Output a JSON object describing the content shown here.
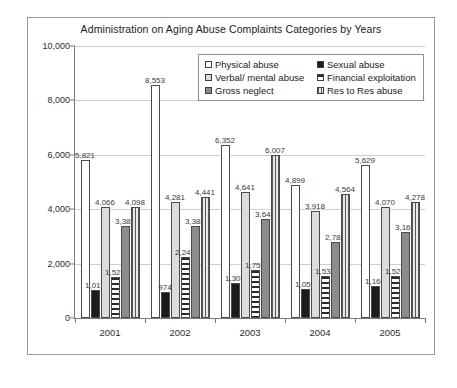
{
  "chart_data": {
    "type": "bar",
    "title": "Administration on Aging Abuse Complaints Categories by Years",
    "xlabel": "",
    "ylabel": "",
    "ylim": [
      0,
      10000
    ],
    "grid": true,
    "legend_position": "top-center-inside",
    "categories": [
      "2001",
      "2002",
      "2003",
      "2004",
      "2005"
    ],
    "ytick_labels": [
      "0",
      "2,000",
      "4,000",
      "6,000",
      "8,000",
      "10,000"
    ],
    "ytick_values": [
      0,
      2000,
      4000,
      6000,
      8000,
      10000
    ],
    "series": [
      {
        "name": "Physical abuse",
        "pattern": "white",
        "values": [
          5821,
          8553,
          6352,
          4899,
          5629
        ],
        "labels": [
          "5,821",
          "8,553",
          "6,352",
          "4,899",
          "5,629"
        ]
      },
      {
        "name": "Sexual abuse",
        "pattern": "black",
        "values": [
          1019,
          974,
          1302,
          1059,
          1160
        ],
        "labels": [
          "1,019",
          "974",
          "1,302",
          "1,059",
          "1,160"
        ]
      },
      {
        "name": "Verbal/ mental abuse",
        "pattern": "light-gray",
        "values": [
          4066,
          4281,
          4641,
          3918,
          4070
        ],
        "labels": [
          "4,066",
          "4,281",
          "4,641",
          "3,918",
          "4,070"
        ]
      },
      {
        "name": "Financial exploitation",
        "pattern": "horizontal-stripe",
        "values": [
          1522,
          2241,
          1755,
          1538,
          1528
        ],
        "labels": [
          "1,522",
          "2,241",
          "1,755",
          "1,538",
          "1,528"
        ]
      },
      {
        "name": "Gross neglect",
        "pattern": "dark-gray",
        "values": [
          3385,
          3385,
          3645,
          2785,
          3165
        ],
        "labels": [
          "3,385",
          "3,385",
          "3,645",
          "2,785",
          "3,165"
        ]
      },
      {
        "name": "Res to Res abuse",
        "pattern": "vertical-stripe",
        "values": [
          4098,
          4441,
          6007,
          4564,
          4278
        ],
        "labels": [
          "4,098",
          "4,441",
          "6,007",
          "4,564",
          "4,278"
        ]
      }
    ]
  },
  "legend": {
    "items": [
      {
        "label": "Physical abuse",
        "pattern": "white"
      },
      {
        "label": "Sexual abuse",
        "pattern": "black"
      },
      {
        "label": "Verbal/ mental abuse",
        "pattern": "light-gray"
      },
      {
        "label": "Financial exploitation",
        "pattern": "horizontal-stripe"
      },
      {
        "label": "Gross neglect",
        "pattern": "dark-gray"
      },
      {
        "label": "Res to Res abuse",
        "pattern": "vertical-stripe"
      }
    ]
  },
  "colors": {
    "frame_border": "#999999",
    "axis": "#7a7a7a",
    "gridline": "#cfcfcf",
    "text": "#1a1a1a",
    "bar_outline": "#4a4a4a"
  }
}
